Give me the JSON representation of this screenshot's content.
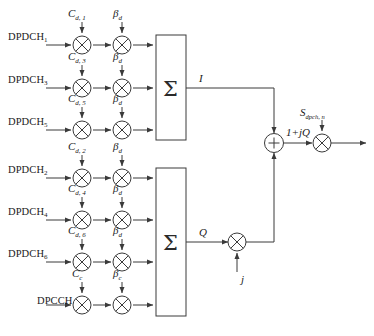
{
  "diagram": {
    "canvas": {
      "width": 374,
      "height": 336,
      "background": "#ffffff"
    },
    "stroke_color": "#3a3a3a",
    "branches_i": [
      {
        "channel": "DPDCH",
        "channel_sub": "1",
        "code": "C",
        "code_sub": "d, 1",
        "gain": "β",
        "gain_sub": "d",
        "row_y": 45
      },
      {
        "channel": "DPDCH",
        "channel_sub": "3",
        "code": "C",
        "code_sub": "d, 3",
        "gain": "β",
        "gain_sub": "d",
        "row_y": 88
      },
      {
        "channel": "DPDCH",
        "channel_sub": "5",
        "code": "C",
        "code_sub": "d, 5",
        "gain": "β",
        "gain_sub": "d",
        "row_y": 130
      }
    ],
    "branches_q": [
      {
        "channel": "DPDCH",
        "channel_sub": "2",
        "code": "C",
        "code_sub": "d, 2",
        "gain": "β",
        "gain_sub": "d",
        "row_y": 178
      },
      {
        "channel": "DPDCH",
        "channel_sub": "4",
        "code": "C",
        "code_sub": "d, 4",
        "gain": "β",
        "gain_sub": "d",
        "row_y": 220
      },
      {
        "channel": "DPDCH",
        "channel_sub": "6",
        "code": "C",
        "code_sub": "d, 6",
        "gain": "β",
        "gain_sub": "d",
        "row_y": 262
      },
      {
        "channel": "DPCCH",
        "channel_sub": "",
        "code": "C",
        "code_sub": "c",
        "gain": "β",
        "gain_sub": "c",
        "row_y": 305
      }
    ],
    "summers": [
      {
        "name": "i-summer",
        "symbol": "Σ",
        "output_label": "I"
      },
      {
        "name": "q-summer",
        "symbol": "Σ",
        "output_label": "Q"
      }
    ],
    "j_multiplier_label": "j",
    "adder_symbol": "+",
    "complex_signal_label": "1+jQ",
    "scrambling_code": "S",
    "scrambling_code_sub": "dpch, n",
    "multiplier_symbol": "×"
  }
}
